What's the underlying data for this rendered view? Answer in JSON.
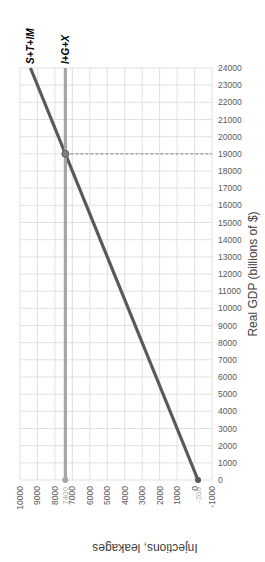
{
  "chart_data": {
    "type": "line",
    "orientation": "rotated 90deg clockwise (values axis reversed along bottom, GDP axis on right)",
    "title": "",
    "xlabel": "Injections, leakages",
    "ylabel": "Real GDP (billions of $)",
    "x_ticks": [
      "10000",
      "9000",
      "8000",
      "7000",
      "6000",
      "5000",
      "4000",
      "3000",
      "2000",
      "1000",
      "0",
      "-1000"
    ],
    "y_ticks": [
      "0",
      "1000",
      "2000",
      "3000",
      "4000",
      "5000",
      "6000",
      "7000",
      "8000",
      "9000",
      "10000",
      "11000",
      "12000",
      "13000",
      "14000",
      "15000",
      "16000",
      "17000",
      "18000",
      "19000",
      "20000",
      "21000",
      "22000",
      "23000",
      "24000"
    ],
    "xlim": [
      10000,
      -1000
    ],
    "ylim": [
      0,
      24000
    ],
    "grid": true,
    "series": [
      {
        "name": "S+T+IM",
        "points": [
          {
            "gdp": 0,
            "value": -200
          },
          {
            "gdp": 24000,
            "value": 9400
          }
        ],
        "color": "#595959",
        "start_label": "-200"
      },
      {
        "name": "I+G+X",
        "points": [
          {
            "gdp": 0,
            "value": 7400
          },
          {
            "gdp": 24000,
            "value": 7400
          }
        ],
        "color": "#a6a6a6",
        "start_label": "7400"
      }
    ],
    "annotations": [
      {
        "type": "equilibrium-point",
        "gdp": 19000,
        "value": 7400
      },
      {
        "type": "dashed-line",
        "from_value": 7400,
        "to_value": -1000,
        "gdp": 19000
      }
    ]
  }
}
